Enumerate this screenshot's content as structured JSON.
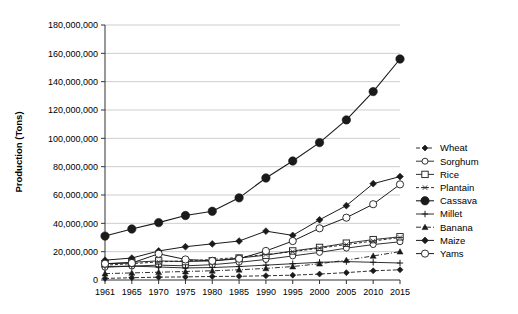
{
  "chart_data": {
    "type": "line",
    "title": "",
    "xlabel": "",
    "ylabel": "Production (Tons)",
    "x": [
      1961,
      1965,
      1970,
      1975,
      1980,
      1985,
      1990,
      1995,
      2000,
      2005,
      2010,
      2015
    ],
    "xtick_labels": [
      "1961",
      "1965",
      "1970",
      "1975",
      "1980",
      "1985",
      "1990",
      "1995",
      "2000",
      "2005",
      "2010",
      "2015"
    ],
    "ytick_labels": [
      "0",
      "20,000,000",
      "40,000,000",
      "60,000,000",
      "80,000,000",
      "100,000,000",
      "120,000,000",
      "140,000,000",
      "160,000,000",
      "180,000,000"
    ],
    "ytick_values": [
      0,
      20000000,
      40000000,
      60000000,
      80000000,
      100000000,
      120000000,
      140000000,
      160000000,
      180000000
    ],
    "ylim": [
      0,
      180000000
    ],
    "grid": true,
    "legend_position": "right",
    "series": [
      {
        "name": "Wheat",
        "marker": "filled-diamond",
        "dash": "4 2",
        "marker_size": 3.0,
        "line_width": 0.9,
        "values": [
          1100000,
          1600000,
          2000000,
          2200000,
          2500000,
          2600000,
          3000000,
          3400000,
          4200000,
          5200000,
          6500000,
          7200000
        ]
      },
      {
        "name": "Sorghum",
        "marker": "open-circle",
        "dash": "",
        "marker_size": 3.0,
        "line_width": 0.9,
        "values": [
          9000000,
          9800000,
          10500000,
          10000000,
          10800000,
          12500000,
          14500000,
          17000000,
          19500000,
          22500000,
          25000000,
          27000000
        ]
      },
      {
        "name": "Rice",
        "marker": "open-square",
        "dash": "",
        "marker_size": 3.2,
        "line_width": 0.9,
        "values": [
          11500000,
          12500000,
          13500000,
          13000000,
          13500000,
          15500000,
          17500000,
          20500000,
          23000000,
          26000000,
          28500000,
          30500000
        ]
      },
      {
        "name": "Plantain",
        "marker": "asterisk",
        "dash": "3 2",
        "marker_size": 3.0,
        "line_width": 0.9,
        "values": [
          10500000,
          11500000,
          12800000,
          13500000,
          14500000,
          16000000,
          18000000,
          20000000,
          22500000,
          25000000,
          27500000,
          30000000
        ]
      },
      {
        "name": "Cassava",
        "marker": "large-filled-circle",
        "dash": "",
        "marker_size": 4.2,
        "line_width": 1.1,
        "values": [
          31000000,
          36000000,
          40500000,
          45500000,
          48500000,
          58000000,
          72000000,
          84000000,
          97000000,
          113000000,
          133000000,
          156000000
        ]
      },
      {
        "name": "Millet",
        "marker": "plus",
        "dash": "",
        "marker_size": 3.2,
        "line_width": 0.9,
        "values": [
          9500000,
          9800000,
          9200000,
          8500000,
          8800000,
          9500000,
          10500000,
          11500000,
          12500000,
          13000000,
          12500000,
          12000000
        ]
      },
      {
        "name": "Banana",
        "marker": "small-triangle",
        "dash": "5 2 1 2",
        "marker_size": 3.0,
        "line_width": 0.9,
        "values": [
          4500000,
          5000000,
          5500000,
          6000000,
          6500000,
          7200000,
          8200000,
          9500000,
          11500000,
          14000000,
          17000000,
          20000000
        ]
      },
      {
        "name": "Maize",
        "marker": "filled-diamond",
        "dash": "",
        "marker_size": 3.4,
        "line_width": 1.0,
        "values": [
          14000000,
          15500000,
          20500000,
          23500000,
          25500000,
          27500000,
          34500000,
          31500000,
          42500000,
          52500000,
          68000000,
          73000000
        ]
      },
      {
        "name": "Yams",
        "marker": "open-circle",
        "dash": "",
        "marker_size": 3.6,
        "line_width": 1.0,
        "values": [
          11500000,
          12000000,
          18500000,
          14500000,
          13500000,
          15000000,
          20500000,
          27500000,
          36500000,
          44000000,
          53500000,
          67500000
        ]
      }
    ]
  },
  "colors": {
    "ink": "#1a1a1a",
    "grid": "#b9b9b9",
    "axis": "#333333",
    "background": "#ffffff"
  }
}
